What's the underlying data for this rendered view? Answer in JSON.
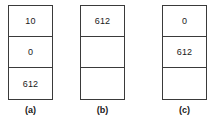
{
  "figure": {
    "type": "three-panel-stack-diagram",
    "colors": {
      "background": "#ffffff",
      "border": "#3a3a3a",
      "text": "#1a1a1a"
    },
    "panels": [
      {
        "id": "a",
        "label": "(a)",
        "cells": [
          {
            "value": "10",
            "empty": false
          },
          {
            "value": "0",
            "empty": false
          },
          {
            "value": "612",
            "empty": false
          }
        ]
      },
      {
        "id": "b",
        "label": "(b)",
        "cells": [
          {
            "value": "612",
            "empty": false
          },
          {
            "value": "",
            "empty": true
          },
          {
            "value": "",
            "empty": true
          }
        ]
      },
      {
        "id": "c",
        "label": "(c)",
        "cells": [
          {
            "value": "0",
            "empty": false
          },
          {
            "value": "612",
            "empty": false
          },
          {
            "value": "",
            "empty": true
          }
        ]
      }
    ]
  }
}
